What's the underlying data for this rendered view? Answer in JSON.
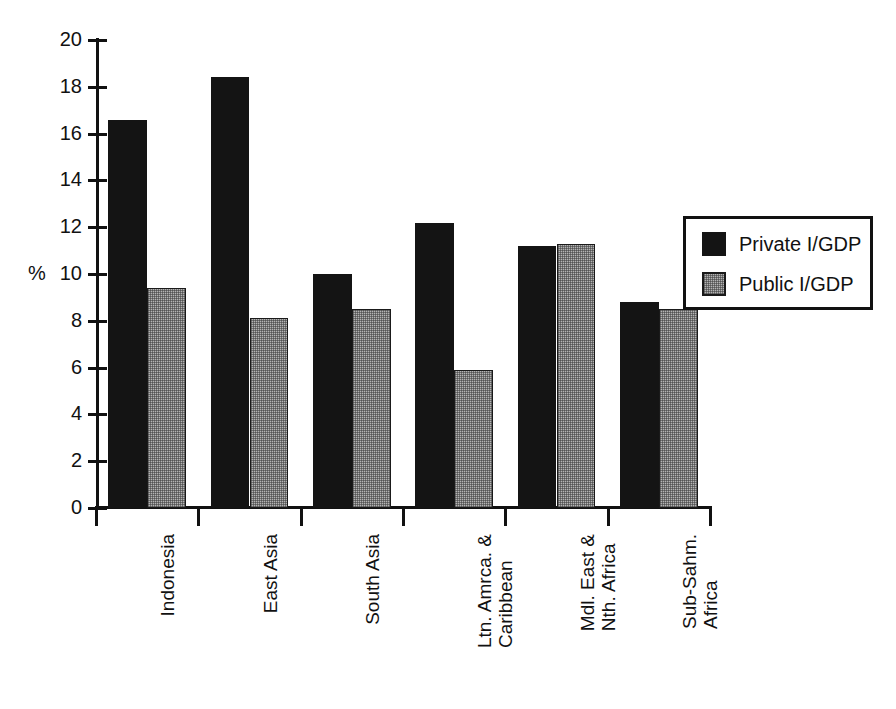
{
  "chart_data": {
    "type": "bar",
    "title": "",
    "xlabel": "",
    "ylabel": "%",
    "ylim": [
      0,
      20
    ],
    "ytick_values": [
      0,
      2,
      4,
      6,
      8,
      10,
      12,
      14,
      16,
      18,
      20
    ],
    "ytick_labels": [
      "0",
      "2",
      "4",
      "6",
      "8",
      "10",
      "12",
      "14",
      "16",
      "18",
      "20"
    ],
    "grid": false,
    "legend_position": "right",
    "categories": [
      "Indonesia",
      "East Asia",
      "South Asia",
      "Ltn. Amrca. & Caribbean",
      "Mdl. East & Nth. Africa",
      "Sub-Sahm. Africa"
    ],
    "category_lines": [
      [
        "Indonesia"
      ],
      [
        "East Asia"
      ],
      [
        "South Asia"
      ],
      [
        "Ltn. Amrca. &",
        "Caribbean"
      ],
      [
        "Mdl. East &",
        "Nth. Africa"
      ],
      [
        "Sub-Sahm.",
        "Africa"
      ]
    ],
    "series": [
      {
        "name": "Private I/GDP",
        "color": "#141414",
        "values": [
          16.6,
          18.4,
          10.0,
          12.2,
          11.2,
          8.8
        ]
      },
      {
        "name": "Public I/GDP",
        "color": "#b4b4b4",
        "values": [
          9.4,
          8.1,
          8.5,
          5.9,
          11.3,
          8.5
        ]
      }
    ]
  },
  "axis": {
    "y_unit_label": "%"
  },
  "legend": {
    "entries": [
      {
        "label": "Private I/GDP",
        "swatch": "black-solid"
      },
      {
        "label": "Public I/GDP",
        "swatch": "gray-hatched"
      }
    ]
  }
}
